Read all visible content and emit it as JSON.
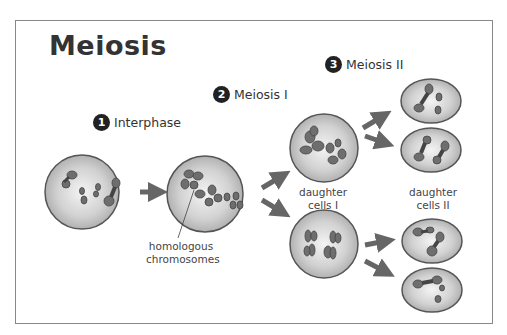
{
  "diagram": {
    "title": "Meiosis",
    "steps": [
      {
        "number": "1",
        "label": "Interphase"
      },
      {
        "number": "2",
        "label": "Meiosis I"
      },
      {
        "number": "3",
        "label": "Meiosis II"
      }
    ],
    "annotations": {
      "homologous": "homologous chromosomes",
      "homologous_line1": "homologous",
      "homologous_line2": "chromosomes",
      "daughter_cells_1_line1": "daughter",
      "daughter_cells_1_line2": "cells I",
      "daughter_cells_2_line1": "daughter",
      "daughter_cells_2_line2": "cells II"
    },
    "colors": {
      "cell_fill": "#d4d4d4",
      "cell_border": "#555555",
      "chromosome": "#6e6e6e",
      "arrow": "#666666",
      "text": "#333333"
    }
  }
}
